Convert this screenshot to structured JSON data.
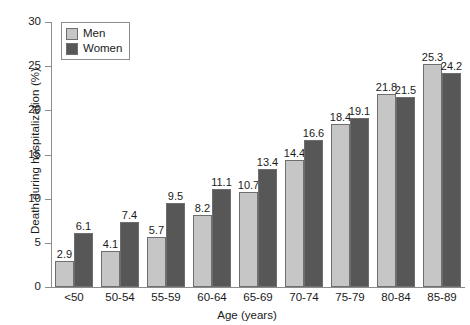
{
  "chart_data": {
    "type": "bar",
    "title": "",
    "xlabel": "Age (years)",
    "ylabel": "Death during hospitalization (%)",
    "categories": [
      "<50",
      "50-54",
      "55-59",
      "60-64",
      "65-69",
      "70-74",
      "75-79",
      "80-84",
      "85-89"
    ],
    "series": [
      {
        "name": "Men",
        "color": "#c6c6c6",
        "values": [
          2.9,
          4.1,
          5.7,
          8.2,
          10.7,
          14.4,
          18.4,
          21.8,
          25.3
        ]
      },
      {
        "name": "Women",
        "color": "#575757",
        "values": [
          6.1,
          7.4,
          9.5,
          11.1,
          13.4,
          16.6,
          19.1,
          21.5,
          24.2
        ]
      }
    ],
    "ylim": [
      0,
      30
    ],
    "yticks": [
      0,
      5,
      10,
      15,
      20,
      25,
      30
    ],
    "ytick_labels": [
      "0",
      "5",
      "10",
      "15",
      "20",
      "25",
      "30"
    ],
    "grid": false,
    "legend_position": "top-left",
    "data_labels": true
  },
  "legend": {
    "items": [
      {
        "label": "Men"
      },
      {
        "label": "Women"
      }
    ]
  },
  "axes": {
    "y_title": "Death during hospitalization (%)",
    "x_title": "Age (years)"
  }
}
